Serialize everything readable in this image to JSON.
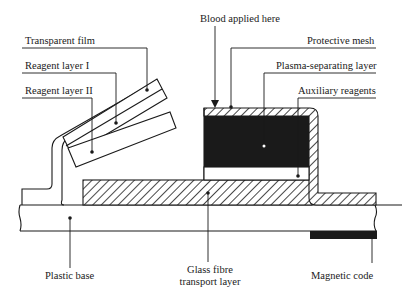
{
  "diagram": {
    "type": "cross-section schematic",
    "colors": {
      "ink": "#1a1a1a",
      "background": "#ffffff"
    },
    "labels": {
      "transparent_film": "Transparent film",
      "reagent_layer_1": "Reagent layer I",
      "reagent_layer_2": "Reagent layer II",
      "blood_applied": "Blood applied here",
      "protective_mesh": "Protective mesh",
      "plasma_separating": "Plasma-separating layer",
      "auxiliary_reagents": "Auxiliary reagents",
      "plastic_base": "Plastic base",
      "glass_fibre_line1": "Glass fibre",
      "glass_fibre_line2": "transport layer",
      "magnetic_code": "Magnetic code"
    }
  }
}
